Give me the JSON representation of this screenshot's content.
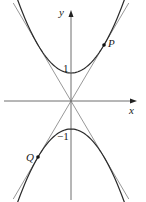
{
  "figure": {
    "type": "parabolas-with-common-tangents",
    "axes": {
      "x_label": "x",
      "y_label": "y",
      "origin_px": [
        71,
        101
      ],
      "scale_px_per_unit": {
        "x": 33,
        "y": 28
      }
    },
    "curves": [
      {
        "name": "upper-parabola",
        "equation": "y = 1 + x^2",
        "vertex": [
          0,
          1
        ],
        "vertex_label": "1"
      },
      {
        "name": "lower-parabola",
        "equation": "y = -1 - x^2",
        "vertex": [
          0,
          -1
        ],
        "vertex_label": "−1"
      }
    ],
    "tangent_lines": [
      {
        "name": "tangent-line-positive",
        "equation": "y = 2x"
      },
      {
        "name": "tangent-line-negative",
        "equation": "y = -2x"
      }
    ],
    "points": [
      {
        "name": "P",
        "label": "P",
        "coords": [
          1,
          2
        ]
      },
      {
        "name": "Q",
        "label": "Q",
        "coords": [
          -1,
          -2
        ]
      }
    ],
    "colors": {
      "curve": "#2a2a2a",
      "tangent": "#8c8c8c",
      "axis": "#6e6e6e",
      "text": "#1a1a1a"
    }
  }
}
